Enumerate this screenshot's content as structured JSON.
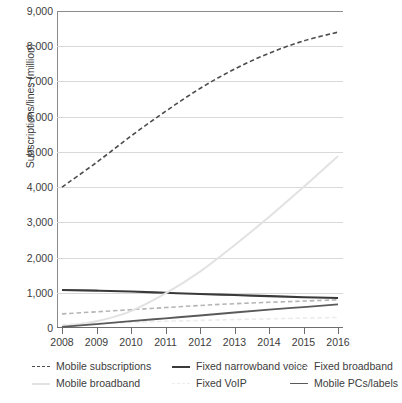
{
  "chart_data": {
    "type": "line",
    "title": "",
    "xlabel": "",
    "ylabel": "Subscriptions/lines (million)",
    "categories": [
      "2008",
      "2009",
      "2010",
      "2011",
      "2012",
      "2013",
      "2014",
      "2015",
      "2016"
    ],
    "x": [
      2008,
      2009,
      2010,
      2011,
      2012,
      2013,
      2014,
      2015,
      2016
    ],
    "ylim": [
      0,
      9000
    ],
    "xlim": [
      2008,
      2016
    ],
    "yticks": [
      "0",
      "1,000",
      "2,000",
      "3,000",
      "4,000",
      "5,000",
      "6,000",
      "7,000",
      "8,000",
      "9,000"
    ],
    "ytick_values": [
      0,
      1000,
      2000,
      3000,
      4000,
      5000,
      6000,
      7000,
      8000,
      9000
    ],
    "grid": "horizontal",
    "legend_position": "bottom",
    "series": [
      {
        "name": "Mobile subscriptions",
        "values": [
          4000,
          4700,
          5450,
          6150,
          6800,
          7350,
          7800,
          8150,
          8400
        ],
        "style": "dashed",
        "color": "#4d4d4d",
        "width": 1.6
      },
      {
        "name": "Fixed narrowband voice",
        "values": [
          1080,
          1060,
          1035,
          1000,
          965,
          935,
          905,
          875,
          850
        ],
        "style": "solid",
        "color": "#3a3a3a",
        "width": 2.1
      },
      {
        "name": "Fixed broadband",
        "values": [
          400,
          460,
          520,
          580,
          640,
          690,
          730,
          765,
          800
        ],
        "style": "dashed",
        "color": "#b5b5b5",
        "width": 1.6
      },
      {
        "name": "Mobile broadband",
        "values": [
          50,
          190,
          480,
          980,
          1600,
          2350,
          3150,
          4000,
          4880
        ],
        "style": "solid",
        "color": "#e2e2e2",
        "width": 2.0
      },
      {
        "name": "Fixed VoIP",
        "values": [
          100,
          130,
          160,
          190,
          215,
          240,
          260,
          280,
          300
        ],
        "style": "dashed",
        "color": "#ececec",
        "width": 1.6
      },
      {
        "name": "Mobile PCs/labels",
        "values": [
          30,
          110,
          195,
          275,
          355,
          440,
          520,
          595,
          670
        ],
        "style": "solid",
        "color": "#5a5a5a",
        "width": 1.8
      }
    ]
  },
  "legend": {
    "rows": [
      [
        "Mobile subscriptions",
        "Fixed narrowband voice",
        "Fixed broadband"
      ],
      [
        "Mobile broadband",
        "Fixed VoIP",
        "Mobile PCs/labels"
      ]
    ]
  }
}
